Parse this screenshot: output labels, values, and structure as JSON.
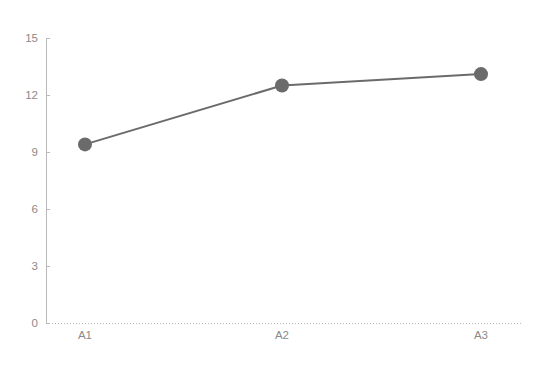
{
  "chart_data": {
    "type": "line",
    "title": "",
    "subtitle": "",
    "xlabel": "",
    "ylabel": "",
    "categories": [
      "A1",
      "A2",
      "A3"
    ],
    "values": [
      9.4,
      12.5,
      13.1
    ],
    "series": [
      {
        "name": "",
        "values": [
          9.4,
          12.5,
          13.1
        ]
      }
    ],
    "ylim": [
      0,
      15
    ],
    "yticks": [
      0,
      3,
      6,
      9,
      12,
      15
    ],
    "ytick_labels": [
      "0",
      "3",
      "6",
      "9",
      "12",
      "15"
    ],
    "xtick_labels": [
      "A1",
      "A2",
      "A3"
    ],
    "grid": false,
    "legend": false,
    "legend_position": "none",
    "markers": true,
    "marker_shape": "circle",
    "colors": {
      "line": "#6b6b6b",
      "marker": "#6b6b6b",
      "axis": "#b9b9b9",
      "tick_text": "#8a8a8a",
      "background": "#ffffff"
    },
    "annotations": []
  },
  "axes": {
    "y_axis_name": "value-axis",
    "x_axis_name": "category-axis"
  }
}
